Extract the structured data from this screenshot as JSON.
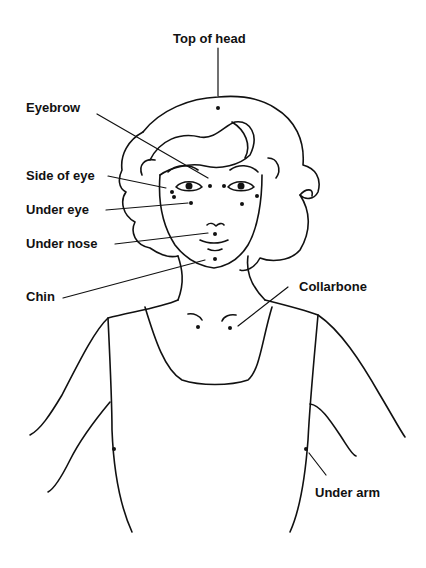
{
  "diagram": {
    "type": "tapping-points-figure",
    "labels": [
      {
        "id": "top-of-head",
        "text": "Top of head",
        "x": 173,
        "y": 32
      },
      {
        "id": "eyebrow",
        "text": "Eyebrow",
        "x": 26,
        "y": 101
      },
      {
        "id": "side-of-eye",
        "text": "Side of eye",
        "x": 26,
        "y": 169
      },
      {
        "id": "under-eye",
        "text": "Under eye",
        "x": 26,
        "y": 203
      },
      {
        "id": "under-nose",
        "text": "Under nose",
        "x": 26,
        "y": 237
      },
      {
        "id": "chin",
        "text": "Chin",
        "x": 26,
        "y": 290
      },
      {
        "id": "collarbone",
        "text": "Collarbone",
        "x": 299,
        "y": 280
      },
      {
        "id": "under-arm",
        "text": "Under arm",
        "x": 315,
        "y": 486
      }
    ]
  }
}
